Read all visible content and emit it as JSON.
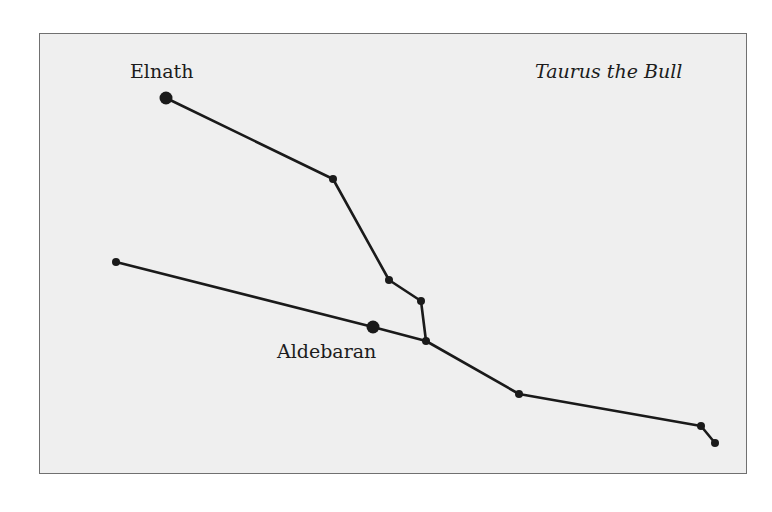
{
  "diagram": {
    "title": "Taurus the Bull",
    "frame": {
      "x": 39,
      "y": 33,
      "width": 708,
      "height": 441,
      "background": "#efefef",
      "border": "#707070"
    },
    "line_color": "#1a1a1a",
    "labels": [
      {
        "id": "elnath",
        "text": "Elnath",
        "x": 130,
        "y": 62
      },
      {
        "id": "aldebaran",
        "text": "Aldebaran",
        "x": 277,
        "y": 342
      }
    ],
    "stars": [
      {
        "id": "elnath",
        "name": "Elnath",
        "x": 166,
        "y": 98,
        "r": 6.5
      },
      {
        "id": "s2",
        "x": 333,
        "y": 179,
        "r": 4
      },
      {
        "id": "s3",
        "x": 389,
        "y": 280,
        "r": 4
      },
      {
        "id": "s4",
        "x": 421,
        "y": 301,
        "r": 4
      },
      {
        "id": "s5",
        "x": 426,
        "y": 341,
        "r": 4
      },
      {
        "id": "s6",
        "x": 116,
        "y": 262,
        "r": 4
      },
      {
        "id": "aldebaran",
        "name": "Aldebaran",
        "x": 373,
        "y": 327,
        "r": 6.5
      },
      {
        "id": "s8",
        "x": 519,
        "y": 394,
        "r": 4
      },
      {
        "id": "s9",
        "x": 701,
        "y": 426,
        "r": 4
      },
      {
        "id": "s10",
        "x": 715,
        "y": 443,
        "r": 4
      }
    ],
    "lines": [
      {
        "from": "elnath",
        "to": "s2"
      },
      {
        "from": "s2",
        "to": "s3"
      },
      {
        "from": "s3",
        "to": "s4"
      },
      {
        "from": "s4",
        "to": "s5"
      },
      {
        "from": "s6",
        "to": "aldebaran"
      },
      {
        "from": "aldebaran",
        "to": "s5"
      },
      {
        "from": "s5",
        "to": "s8"
      },
      {
        "from": "s8",
        "to": "s9"
      },
      {
        "from": "s9",
        "to": "s10"
      }
    ]
  }
}
